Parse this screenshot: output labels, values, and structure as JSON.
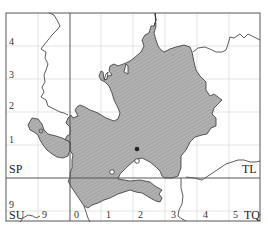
{
  "map": {
    "type": "distribution-grid-map",
    "colors": {
      "frame": "#555555",
      "minor_grid": "#d8d8d8",
      "major_grid": "#555555",
      "boundary": "#333333",
      "region_fill": "#a9a9a9",
      "hatch": "#bdbdbd",
      "record_present": "#222222",
      "record_old": "#ffffff"
    },
    "grid_squares": [
      {
        "code": "SP",
        "position": "upper-left"
      },
      {
        "code": "TL",
        "position": "upper-right"
      },
      {
        "code": "SU",
        "position": "lower-left"
      },
      {
        "code": "TQ",
        "position": "lower-right"
      }
    ],
    "left_axis_labels": [
      "4",
      "3",
      "2",
      "1",
      "9"
    ],
    "bottom_axis_labels": [
      "9",
      "0",
      "1",
      "2",
      "3",
      "4",
      "5"
    ],
    "records": [
      {
        "kind": "filled-dot",
        "x": 137,
        "y": 149
      },
      {
        "kind": "open-circle",
        "x": 137,
        "y": 161
      },
      {
        "kind": "open-circle",
        "x": 112,
        "y": 172
      },
      {
        "kind": "open-circle",
        "x": 41,
        "y": 131
      }
    ]
  }
}
